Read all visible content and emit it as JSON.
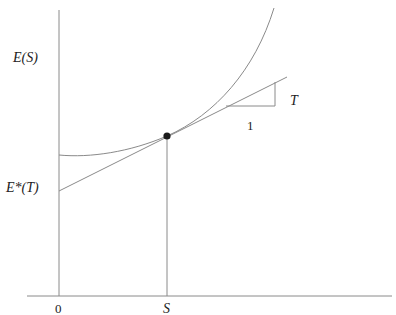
{
  "diagram": {
    "labels": {
      "y_axis": "E(S)",
      "intercept": "E*(T)",
      "slope": "T",
      "run": "1",
      "origin": "0",
      "x_point": "S"
    },
    "colors": {
      "lines": "#8a8a8a",
      "point": "#1a1a1a",
      "text": "#222222"
    }
  }
}
